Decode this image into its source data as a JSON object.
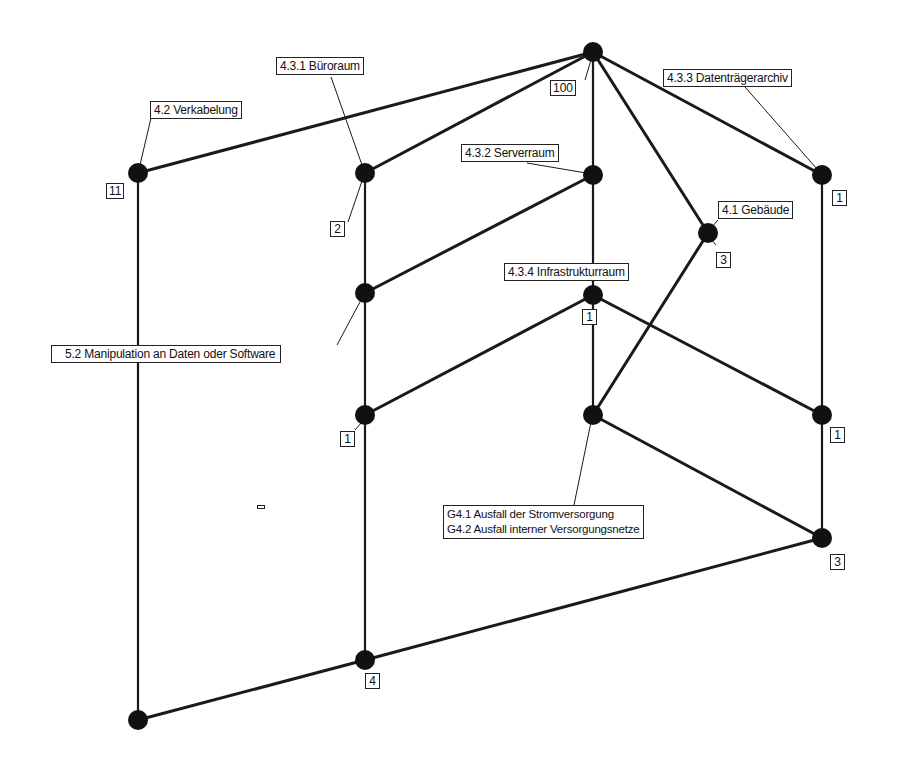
{
  "diagram": {
    "type": "lattice / Hasse diagram",
    "nodes": [
      {
        "id": "top",
        "x": 593,
        "y": 52,
        "count": "100"
      },
      {
        "id": "verkabelung",
        "x": 138,
        "y": 173,
        "label": "4.2 Verkabelung",
        "count": "11"
      },
      {
        "id": "bueroraum",
        "x": 365,
        "y": 173,
        "label": "4.3.1 Büroraum",
        "count": "2"
      },
      {
        "id": "serverraum",
        "x": 593,
        "y": 175,
        "label": "4.3.2 Serverraum"
      },
      {
        "id": "datentraegerarchiv",
        "x": 822,
        "y": 175,
        "label": "4.3.3 Datenträgerarchiv",
        "count": "1"
      },
      {
        "id": "gebaeude",
        "x": 708,
        "y": 233,
        "label": "4.1 Gebäude",
        "count": "3"
      },
      {
        "id": "manipulation",
        "x": 365,
        "y": 293,
        "label": "5.2 Manipulation an Daten oder Software"
      },
      {
        "id": "infrastrukturraum",
        "x": 593,
        "y": 295,
        "label": "4.3.4 Infrastrukturraum",
        "count": "1"
      },
      {
        "id": "n_left_mid",
        "x": 365,
        "y": 415,
        "count": "1"
      },
      {
        "id": "stromversorgung",
        "x": 593,
        "y": 415,
        "label_lines": [
          "G4.1 Ausfall der Stromversorgung",
          "G4.2 Ausfall interner Versorgungsnetze"
        ]
      },
      {
        "id": "n_right_mid",
        "x": 822,
        "y": 415,
        "count": "1"
      },
      {
        "id": "n_right_low",
        "x": 822,
        "y": 538,
        "count": "3"
      },
      {
        "id": "n_bottom_mid",
        "x": 365,
        "y": 660,
        "count": "4"
      },
      {
        "id": "bottom",
        "x": 138,
        "y": 720
      }
    ],
    "edges": [
      [
        "top",
        "verkabelung"
      ],
      [
        "top",
        "bueroraum"
      ],
      [
        "top",
        "serverraum"
      ],
      [
        "top",
        "gebaeude"
      ],
      [
        "top",
        "datentraegerarchiv"
      ],
      [
        "verkabelung",
        "bottom"
      ],
      [
        "bueroraum",
        "manipulation"
      ],
      [
        "serverraum",
        "manipulation"
      ],
      [
        "serverraum",
        "infrastrukturraum"
      ],
      [
        "manipulation",
        "n_left_mid"
      ],
      [
        "infrastrukturraum",
        "n_left_mid"
      ],
      [
        "infrastrukturraum",
        "stromversorgung"
      ],
      [
        "infrastrukturraum",
        "n_right_mid"
      ],
      [
        "gebaeude",
        "stromversorgung"
      ],
      [
        "datentraegerarchiv",
        "n_right_mid"
      ],
      [
        "n_left_mid",
        "n_bottom_mid"
      ],
      [
        "stromversorgung",
        "n_right_low"
      ],
      [
        "n_right_mid",
        "n_right_low"
      ],
      [
        "n_right_low",
        "n_bottom_mid"
      ],
      [
        "n_bottom_mid",
        "bottom"
      ]
    ]
  },
  "labels": {
    "verkabelung": "4.2 Verkabelung",
    "bueroraum": "4.3.1 Büroraum",
    "serverraum": "4.3.2 Serverraum",
    "datentraegerarchiv": "4.3.3 Datenträgerarchiv",
    "gebaeude": "4.1 Gebäude",
    "infrastrukturraum": "4.3.4 Infrastrukturraum",
    "manipulation": "5.2 Manipulation an Daten oder Software",
    "strom_line1": "G4.1 Ausfall der Stromversorgung",
    "strom_line2": "G4.2 Ausfall interner Versorgungsnetze"
  },
  "counts": {
    "top": "100",
    "verkabelung": "11",
    "bueroraum": "2",
    "datentraegerarchiv": "1",
    "gebaeude": "3",
    "infrastrukturraum": "1",
    "left_mid": "1",
    "right_mid": "1",
    "right_low": "3",
    "bottom_mid": "4"
  },
  "colors": {
    "line": "#1a1a1a",
    "node": "#111111",
    "background": "#ffffff"
  }
}
